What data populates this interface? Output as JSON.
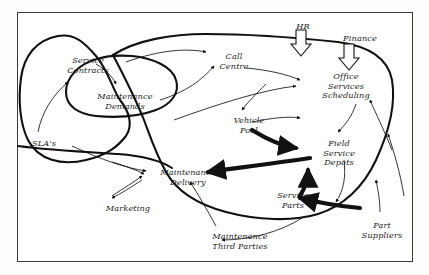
{
  "figure": {
    "top_clipped_text": "",
    "border_color": "#3a3a3a",
    "background_color": "#ffffff",
    "ink_color": "#111111"
  },
  "nodes": [
    {
      "id": "service-contracts",
      "label": "Service\nContracts",
      "x": 60,
      "y": 56,
      "w": 56
    },
    {
      "id": "maintenance-demands",
      "label": "Maintenance\nDemands",
      "x": 92,
      "y": 92,
      "w": 66
    },
    {
      "id": "slas",
      "label": "SLA's",
      "x": 26,
      "y": 139,
      "w": 36
    },
    {
      "id": "call-centre",
      "label": "Call\nCentre",
      "x": 214,
      "y": 52,
      "w": 40
    },
    {
      "id": "hr",
      "label": "HR",
      "x": 291,
      "y": 22,
      "w": 24
    },
    {
      "id": "finance",
      "label": "Finance",
      "x": 339,
      "y": 34,
      "w": 42
    },
    {
      "id": "office-services-scheduling",
      "label": "Office\nServices\nScheduling",
      "x": 316,
      "y": 72,
      "w": 60
    },
    {
      "id": "vehicle-pool",
      "label": "Vehicle\nPool",
      "x": 228,
      "y": 116,
      "w": 42
    },
    {
      "id": "field-service-depots",
      "label": "Field\nService\nDepots",
      "x": 316,
      "y": 139,
      "w": 46
    },
    {
      "id": "maintenance-delivery",
      "label": "Maintenance\nDelivery",
      "x": 155,
      "y": 168,
      "w": 66
    },
    {
      "id": "marketing",
      "label": "Marketing",
      "x": 100,
      "y": 204,
      "w": 56
    },
    {
      "id": "service-parts",
      "label": "Service\nParts",
      "x": 272,
      "y": 191,
      "w": 42
    },
    {
      "id": "maintenance-third-parties",
      "label": "Maintenance\nThird Parties",
      "x": 204,
      "y": 232,
      "w": 72
    },
    {
      "id": "part-suppliers",
      "label": "Part\nSuppliers",
      "x": 358,
      "y": 221,
      "w": 48
    }
  ],
  "boundaries": [
    {
      "id": "sla-boundary",
      "name": "SLA's outer boundary"
    },
    {
      "id": "service-contracts-boundary",
      "name": "Service Contracts boundary"
    },
    {
      "id": "operations-boundary",
      "name": "Operations boundary"
    }
  ],
  "flows": {
    "bold_arrows": [
      {
        "from": "vehicle-pool",
        "to": "field-service-depots"
      },
      {
        "from": "field-service-depots",
        "to": "maintenance-delivery"
      },
      {
        "from": "service-parts",
        "to": "field-service-depots"
      },
      {
        "from": "part-suppliers",
        "to": "service-parts"
      }
    ],
    "block_arrows": [
      {
        "from": "hr",
        "to": "office-services-scheduling"
      },
      {
        "from": "finance",
        "to": "office-services-scheduling"
      }
    ]
  }
}
